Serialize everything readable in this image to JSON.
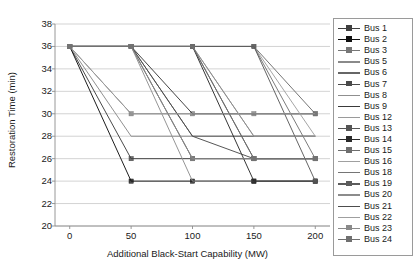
{
  "chart_data": {
    "type": "line",
    "title": "",
    "xlabel": "Additional Black-Start Capability (MW)",
    "ylabel": "Restoration Time (min)",
    "xlim": [
      -12,
      212
    ],
    "ylim": [
      20,
      38
    ],
    "xticks": [
      0,
      50,
      100,
      150,
      200
    ],
    "yticks": [
      20,
      22,
      24,
      26,
      28,
      30,
      32,
      34,
      36,
      38
    ],
    "grid": true,
    "legend_position": "right-outside",
    "x": [
      0,
      50,
      100,
      150,
      200
    ],
    "series": [
      {
        "name": "Bus 1",
        "color": "#3f3f3f",
        "marker": "square",
        "values": [
          36,
          26,
          26,
          26,
          26
        ]
      },
      {
        "name": "Bus 2",
        "color": "#111111",
        "marker": "square",
        "values": [
          36,
          24,
          24,
          24,
          24
        ]
      },
      {
        "name": "Bus 3",
        "color": "#777777",
        "marker": "square",
        "values": [
          36,
          30,
          30,
          30,
          30
        ]
      },
      {
        "name": "Bus 5",
        "color": "#8a8a8a",
        "marker": "none",
        "values": [
          36,
          28,
          28,
          28,
          28
        ]
      },
      {
        "name": "Bus 6",
        "color": "#666666",
        "marker": "none",
        "values": [
          36,
          36,
          28,
          28,
          28
        ]
      },
      {
        "name": "Bus 7",
        "color": "#4a4a4a",
        "marker": "square",
        "values": [
          36,
          36,
          26,
          26,
          26
        ]
      },
      {
        "name": "Bus 8",
        "color": "#8f8f8f",
        "marker": "none",
        "values": [
          36,
          36,
          24,
          24,
          24
        ]
      },
      {
        "name": "Bus 9",
        "color": "#3a3a3a",
        "marker": "none",
        "values": [
          36,
          36,
          30,
          30,
          30
        ]
      },
      {
        "name": "Bus 12",
        "color": "#9a9a9a",
        "marker": "none",
        "values": [
          36,
          36,
          36,
          28,
          28
        ]
      },
      {
        "name": "Bus 13",
        "color": "#555555",
        "marker": "square",
        "values": [
          36,
          36,
          36,
          26,
          26
        ]
      },
      {
        "name": "Bus 14",
        "color": "#2b2b2b",
        "marker": "square",
        "values": [
          36,
          36,
          36,
          24,
          24
        ]
      },
      {
        "name": "Bus 15",
        "color": "#6e6e6e",
        "marker": "square",
        "values": [
          36,
          36,
          36,
          36,
          30
        ]
      },
      {
        "name": "Bus 16",
        "color": "#a0a0a0",
        "marker": "none",
        "values": [
          36,
          36,
          36,
          36,
          28
        ]
      },
      {
        "name": "Bus 18",
        "color": "#757575",
        "marker": "none",
        "values": [
          36,
          36,
          36,
          36,
          26
        ]
      },
      {
        "name": "Bus 19",
        "color": "#5c5c5c",
        "marker": "square",
        "values": [
          36,
          36,
          36,
          36,
          24
        ]
      },
      {
        "name": "Bus 20",
        "color": "#8c8c8c",
        "marker": "none",
        "values": [
          36,
          36,
          36,
          28,
          28
        ]
      },
      {
        "name": "Bus 21",
        "color": "#4d4d4d",
        "marker": "none",
        "values": [
          36,
          36,
          28,
          26,
          26
        ]
      },
      {
        "name": "Bus 22",
        "color": "#9f9f9f",
        "marker": "none",
        "values": [
          36,
          30,
          30,
          30,
          30
        ]
      },
      {
        "name": "Bus 23",
        "color": "#8a8a8a",
        "marker": "square",
        "values": [
          36,
          36,
          26,
          26,
          26
        ]
      },
      {
        "name": "Bus 24",
        "color": "#707070",
        "marker": "square",
        "values": [
          36,
          36,
          36,
          26,
          26
        ]
      }
    ]
  },
  "axes": {
    "ylabel": "Restoration Time (min)",
    "xlabel": "Additional Black-Start Capability (MW)",
    "ytick_labels": [
      "38",
      "36",
      "34",
      "32",
      "30",
      "28",
      "26",
      "24",
      "22",
      "20"
    ],
    "xtick_labels": [
      "0",
      "50",
      "100",
      "150",
      "200"
    ]
  },
  "legend": {
    "items": [
      {
        "label": "Bus 1"
      },
      {
        "label": "Bus 2"
      },
      {
        "label": "Bus 3"
      },
      {
        "label": "Bus 5"
      },
      {
        "label": "Bus 6"
      },
      {
        "label": "Bus 7"
      },
      {
        "label": "Bus 8"
      },
      {
        "label": "Bus 9"
      },
      {
        "label": "Bus 12"
      },
      {
        "label": "Bus 13"
      },
      {
        "label": "Bus 14"
      },
      {
        "label": "Bus 15"
      },
      {
        "label": "Bus 16"
      },
      {
        "label": "Bus 18"
      },
      {
        "label": "Bus 19"
      },
      {
        "label": "Bus 20"
      },
      {
        "label": "Bus 21"
      },
      {
        "label": "Bus 22"
      },
      {
        "label": "Bus 23"
      },
      {
        "label": "Bus 24"
      }
    ]
  }
}
